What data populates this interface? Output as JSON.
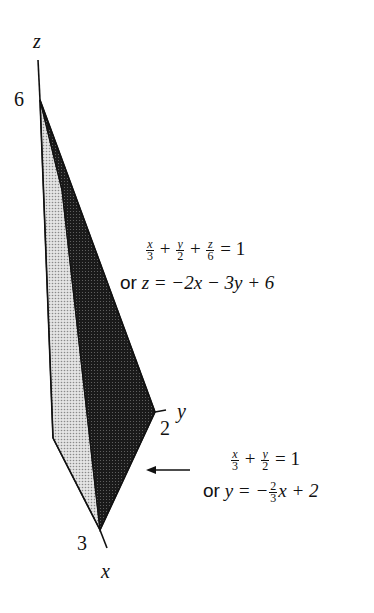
{
  "figure": {
    "axes": {
      "z_label": "z",
      "y_label": "y",
      "x_label": "x",
      "z_intercept": "6",
      "y_intercept": "2",
      "x_intercept": "3"
    },
    "plane_equation": {
      "term1_num": "x",
      "term1_den": "3",
      "plus1": "+",
      "term2_num": "y",
      "term2_den": "2",
      "plus2": "+",
      "term3_num": "z",
      "term3_den": "6",
      "equals": "= 1",
      "alt_prefix": "or",
      "alt_form": "z = −2x − 3y + 6"
    },
    "trace_equation": {
      "term1_num": "x",
      "term1_den": "3",
      "plus1": "+",
      "term2_num": "y",
      "term2_den": "2",
      "equals": "= 1",
      "alt_prefix": "or",
      "alt_lhs": "y = −",
      "alt_frac_num": "2",
      "alt_frac_den": "3",
      "alt_rhs": "x + 2"
    },
    "colors": {
      "dark_face": "#1a1a1a",
      "light_face": "#bdbdbd",
      "stroke": "#111111"
    }
  }
}
